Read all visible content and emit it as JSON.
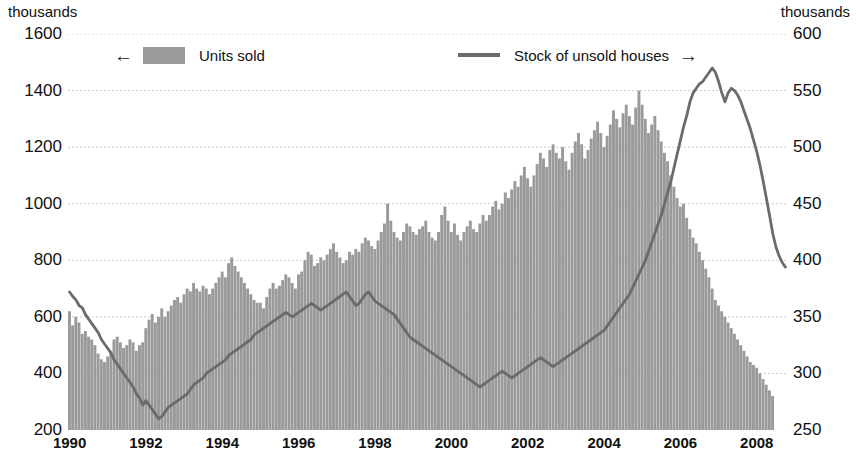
{
  "axes": {
    "left_unit": "thousands",
    "right_unit": "thousands",
    "left_ticks": [
      "1600",
      "1400",
      "1200",
      "1000",
      "800",
      "600",
      "400",
      "200"
    ],
    "right_ticks": [
      "600",
      "550",
      "500",
      "450",
      "400",
      "350",
      "300",
      "250"
    ],
    "x_ticks": [
      "1990",
      "1992",
      "1994",
      "1996",
      "1998",
      "2000",
      "2002",
      "2004",
      "2006",
      "2008"
    ]
  },
  "legend": {
    "units_label": "Units sold",
    "units_arrow": "←",
    "stock_label": "Stock of unsold houses",
    "stock_arrow": "→"
  },
  "colors": {
    "bar": "#9a9a9a",
    "line": "#6b6b6b",
    "grid": "#cccccc",
    "text": "#111111"
  },
  "chart_data": {
    "type": "bar",
    "title": "",
    "subtitle": "",
    "xlabel": "",
    "ylabel": "thousands",
    "y2label": "thousands",
    "ylim": [
      200,
      1600
    ],
    "y2lim": [
      250,
      600
    ],
    "xlim": [
      "1990-01",
      "2008-06"
    ],
    "grid": true,
    "legend_position": "top",
    "x_tick_labels": [
      "1990",
      "1992",
      "1994",
      "1996",
      "1998",
      "2000",
      "2002",
      "2004",
      "2006",
      "2008"
    ],
    "x_tick_years": [
      1990,
      1992,
      1994,
      1996,
      1998,
      2000,
      2002,
      2004,
      2006,
      2008
    ],
    "frequency": "monthly",
    "series": [
      {
        "name": "Units sold",
        "type": "bar",
        "axis": "left",
        "unit": "thousands",
        "color": "#9a9a9a",
        "start": "1990-01",
        "values": [
          620,
          570,
          600,
          580,
          540,
          550,
          530,
          520,
          500,
          470,
          450,
          440,
          460,
          480,
          520,
          530,
          510,
          490,
          500,
          520,
          510,
          480,
          500,
          510,
          560,
          590,
          610,
          580,
          600,
          630,
          600,
          620,
          640,
          660,
          670,
          650,
          680,
          700,
          690,
          720,
          700,
          690,
          710,
          700,
          680,
          700,
          720,
          740,
          760,
          740,
          790,
          810,
          780,
          760,
          740,
          720,
          700,
          680,
          660,
          650,
          650,
          630,
          670,
          700,
          720,
          700,
          710,
          730,
          750,
          740,
          720,
          700,
          750,
          760,
          800,
          830,
          820,
          780,
          790,
          810,
          800,
          820,
          840,
          860,
          830,
          810,
          790,
          800,
          830,
          820,
          840,
          830,
          860,
          880,
          870,
          850,
          840,
          870,
          900,
          930,
          1000,
          940,
          900,
          880,
          870,
          900,
          930,
          920,
          900,
          890,
          910,
          920,
          940,
          900,
          880,
          870,
          900,
          960,
          990,
          940,
          900,
          930,
          890,
          870,
          900,
          920,
          940,
          910,
          900,
          930,
          960,
          940,
          960,
          990,
          1010,
          980,
          1000,
          1040,
          1020,
          1050,
          1080,
          1060,
          1100,
          1130,
          1090,
          1060,
          1100,
          1140,
          1180,
          1160,
          1130,
          1190,
          1210,
          1180,
          1160,
          1200,
          1150,
          1120,
          1180,
          1220,
          1250,
          1210,
          1160,
          1190,
          1230,
          1260,
          1290,
          1250,
          1200,
          1240,
          1280,
          1330,
          1300,
          1270,
          1320,
          1350,
          1310,
          1280,
          1340,
          1400,
          1350,
          1300,
          1250,
          1280,
          1310,
          1260,
          1220,
          1180,
          1150,
          1100,
          1060,
          1020,
          990,
          1000,
          950,
          910,
          880,
          860,
          830,
          800,
          770,
          740,
          700,
          660,
          640,
          620,
          600,
          580,
          560,
          540,
          520,
          500,
          480,
          460,
          440,
          430,
          420,
          400,
          380,
          360,
          340,
          320
        ]
      },
      {
        "name": "Stock of unsold houses",
        "type": "line",
        "axis": "right",
        "unit": "thousands",
        "color": "#6b6b6b",
        "start": "1990-01",
        "values": [
          372,
          368,
          365,
          360,
          358,
          352,
          348,
          344,
          340,
          336,
          330,
          326,
          322,
          318,
          312,
          308,
          304,
          300,
          296,
          292,
          288,
          282,
          278,
          272,
          276,
          272,
          268,
          264,
          260,
          262,
          266,
          270,
          272,
          274,
          276,
          278,
          280,
          282,
          286,
          290,
          292,
          294,
          296,
          300,
          302,
          304,
          306,
          308,
          310,
          312,
          316,
          318,
          320,
          322,
          324,
          326,
          328,
          330,
          334,
          336,
          338,
          340,
          342,
          344,
          346,
          348,
          350,
          352,
          354,
          352,
          350,
          352,
          354,
          356,
          358,
          360,
          362,
          360,
          358,
          356,
          358,
          360,
          362,
          364,
          366,
          368,
          370,
          372,
          368,
          364,
          360,
          362,
          366,
          370,
          372,
          368,
          364,
          362,
          360,
          358,
          356,
          354,
          352,
          348,
          344,
          340,
          336,
          332,
          330,
          328,
          326,
          324,
          322,
          320,
          318,
          316,
          314,
          312,
          310,
          308,
          306,
          304,
          302,
          300,
          298,
          296,
          294,
          292,
          290,
          288,
          290,
          292,
          294,
          296,
          298,
          300,
          302,
          300,
          298,
          296,
          298,
          300,
          302,
          304,
          306,
          308,
          310,
          312,
          314,
          312,
          310,
          308,
          306,
          308,
          310,
          312,
          314,
          316,
          318,
          320,
          322,
          324,
          326,
          328,
          330,
          332,
          334,
          336,
          338,
          342,
          346,
          350,
          354,
          358,
          362,
          366,
          370,
          376,
          382,
          388,
          394,
          400,
          408,
          416,
          424,
          432,
          440,
          450,
          460,
          470,
          482,
          494,
          506,
          518,
          528,
          540,
          548,
          552,
          556,
          558,
          562,
          566,
          570,
          566,
          558,
          548,
          540,
          548,
          552,
          550,
          546,
          540,
          532,
          524,
          516,
          506,
          496,
          484,
          470,
          455,
          440,
          424,
          412,
          404,
          398,
          394
        ]
      }
    ]
  }
}
